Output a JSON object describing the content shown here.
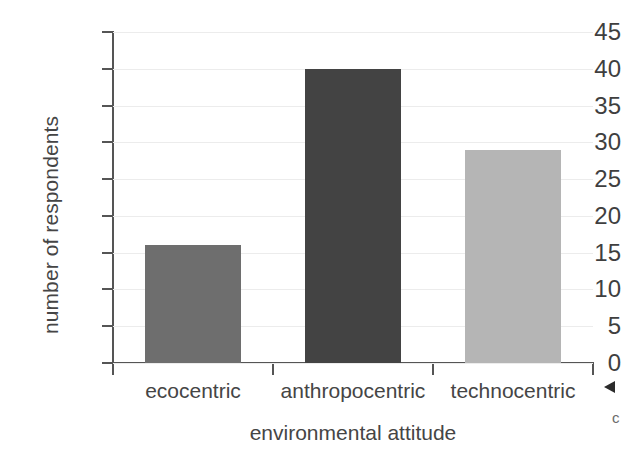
{
  "chart_data": {
    "type": "bar",
    "title": "",
    "xlabel": "environmental attitude",
    "ylabel": "number of respondents",
    "categories": [
      "ecocentric",
      "anthropocentric",
      "technocentric"
    ],
    "values": [
      16,
      40,
      29
    ],
    "bar_colors": [
      "#6e6e6e",
      "#434343",
      "#b5b5b5"
    ],
    "ylim": [
      0,
      45
    ],
    "yticks": [
      45,
      40,
      35,
      30,
      25,
      20,
      15,
      10,
      5,
      0
    ],
    "ytick_labels": [
      "45",
      "40",
      "35",
      "30",
      "25",
      "20",
      "15",
      "10",
      "5",
      "0"
    ],
    "grid": "horizontal",
    "gridline_color": "#ececec",
    "axis_color": "#555555",
    "legend": "none",
    "background": "#ffffff"
  },
  "annotations": {
    "margin_arrow": "left-pointing-arrowhead",
    "margin_mark": "c"
  }
}
